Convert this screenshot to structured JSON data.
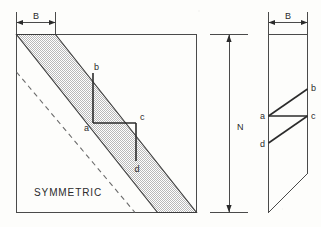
{
  "figure": {
    "caption": "SYMMETRIC",
    "left_panel": {
      "name": "full-matrix-square",
      "bandwidth_label": "B",
      "order_label": "N",
      "points": [
        {
          "id": "a",
          "label": "a"
        },
        {
          "id": "b",
          "label": "b"
        },
        {
          "id": "c",
          "label": "c"
        },
        {
          "id": "d",
          "label": "d"
        }
      ]
    },
    "dimension_vertical": {
      "name": "matrix-order-dimension",
      "label": "N"
    },
    "right_panel": {
      "name": "band-storage-parallelogram",
      "bandwidth_label": "B",
      "points": [
        {
          "id": "a",
          "label": "a"
        },
        {
          "id": "b",
          "label": "b"
        },
        {
          "id": "c",
          "label": "c"
        },
        {
          "id": "d",
          "label": "d"
        }
      ]
    },
    "colors": {
      "line": "#4a4a4a",
      "band_stroke": "#3c3c3c",
      "band_fill": "#d2d2d2",
      "dashed": "#6b6b6b",
      "text": "#2b2b2b",
      "background": "#fdfdfb"
    }
  }
}
